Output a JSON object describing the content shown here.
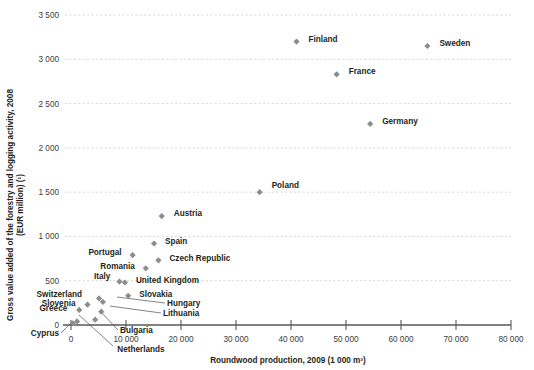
{
  "chart_data": {
    "type": "scatter",
    "title": "",
    "xlabel": "Roundwood production, 2009 (1 000 m³)",
    "ylabel": "Gross value added of the forestry and logging activity, 2008 (EUR million) (¹)",
    "ylabel_line1": "Gross value added of the forestry and logging activity, 2008",
    "ylabel_line2": "(EUR million) (¹)",
    "xlim": [
      0,
      80000
    ],
    "ylim": [
      0,
      3500
    ],
    "xticks": [
      0,
      10000,
      20000,
      30000,
      40000,
      50000,
      60000,
      70000,
      80000
    ],
    "xticklabels": [
      "0",
      "10 000",
      "20 000",
      "30 000",
      "40 000",
      "50 000",
      "60 000",
      "70 000",
      "80 000"
    ],
    "yticks": [
      0,
      500,
      1000,
      1500,
      2000,
      2500,
      3000,
      3500
    ],
    "yticklabels": [
      "0",
      "500",
      "1 000",
      "1 500",
      "2 000",
      "2 500",
      "3 000",
      "3 500"
    ],
    "grid": "horizontal-dashed",
    "legend": "none",
    "marker_color": "#8c8c8c",
    "points": [
      {
        "name": "Finland",
        "x": 41000,
        "y": 3200,
        "lx": 12,
        "ly": -3,
        "anchor": "start"
      },
      {
        "name": "Sweden",
        "x": 64800,
        "y": 3150,
        "lx": 12,
        "ly": -3,
        "anchor": "start"
      },
      {
        "name": "France",
        "x": 48300,
        "y": 2830,
        "lx": 12,
        "ly": -3,
        "anchor": "start"
      },
      {
        "name": "Germany",
        "x": 54400,
        "y": 2270,
        "lx": 12,
        "ly": -3,
        "anchor": "start"
      },
      {
        "name": "Poland",
        "x": 34300,
        "y": 1500,
        "lx": 12,
        "ly": -7,
        "anchor": "start"
      },
      {
        "name": "Austria",
        "x": 16500,
        "y": 1230,
        "lx": 12,
        "ly": -3,
        "anchor": "start"
      },
      {
        "name": "Spain",
        "x": 15100,
        "y": 920,
        "lx": 11,
        "ly": -3,
        "anchor": "start"
      },
      {
        "name": "Portugal",
        "x": 11200,
        "y": 790,
        "lx": -11,
        "ly": -3,
        "anchor": "end"
      },
      {
        "name": "Czech Republic",
        "x": 15900,
        "y": 730,
        "lx": 11,
        "ly": -2,
        "anchor": "start"
      },
      {
        "name": "Romania",
        "x": 13600,
        "y": 640,
        "lx": -11,
        "ly": -2,
        "anchor": "end"
      },
      {
        "name": "United Kingdom",
        "x": 9800,
        "y": 480,
        "lx": 11,
        "ly": -2,
        "anchor": "start"
      },
      {
        "name": "Italy",
        "x": 8800,
        "y": 490,
        "lx": -9,
        "ly": -6,
        "anchor": "end"
      },
      {
        "name": "Slovakia",
        "x": 10400,
        "y": 330,
        "lx": 11,
        "ly": -2,
        "anchor": "start"
      },
      {
        "name": "Switzerland",
        "x": 5100,
        "y": 300,
        "lx": -17,
        "ly": -4,
        "anchor": "end"
      },
      {
        "name": "Slovenia",
        "x": 3000,
        "y": 230,
        "lx": -12,
        "ly": -2,
        "anchor": "end"
      },
      {
        "name": "Hungary",
        "x": 5800,
        "y": 260,
        "lx": 0,
        "ly": 0,
        "anchor": "start"
      },
      {
        "name": "Greece",
        "x": 1500,
        "y": 170,
        "lx": -12,
        "ly": -2,
        "anchor": "end"
      },
      {
        "name": "Lithuania",
        "x": 5500,
        "y": 150,
        "lx": 0,
        "ly": 0,
        "anchor": "start"
      },
      {
        "name": "Bulgaria",
        "x": 4400,
        "y": 60,
        "lx": 0,
        "ly": 0,
        "anchor": "start"
      },
      {
        "name": "Netherlands",
        "x": 1100,
        "y": 40,
        "lx": 0,
        "ly": 0,
        "anchor": "middle"
      },
      {
        "name": "Cyprus",
        "x": 300,
        "y": 20,
        "lx": -10,
        "ly": 11,
        "anchor": "end"
      }
    ],
    "callouts": [
      {
        "name": "Hungary",
        "label_x": 167,
        "label_y": 306,
        "anchor": "start",
        "line": [
          [
            165,
            303
          ],
          [
            117,
            297
          ]
        ]
      },
      {
        "name": "Lithuania",
        "label_x": 163,
        "label_y": 316,
        "anchor": "start",
        "line": [
          [
            161,
            313
          ],
          [
            110,
            306
          ]
        ]
      },
      {
        "name": "Bulgaria",
        "label_x": 120,
        "label_y": 333,
        "anchor": "start",
        "line": [
          [
            118,
            330
          ],
          [
            100,
            311
          ]
        ]
      },
      {
        "name": "Netherlands",
        "label_x": 141,
        "label_y": 352,
        "anchor": "middle",
        "line": [
          [
            113,
            346
          ],
          [
            79,
            315
          ]
        ]
      },
      {
        "name": "Cyprus",
        "label_x": 59,
        "label_y": 336,
        "anchor": "end",
        "line": [
          [
            61,
            333
          ],
          [
            72,
            322
          ]
        ]
      }
    ]
  }
}
